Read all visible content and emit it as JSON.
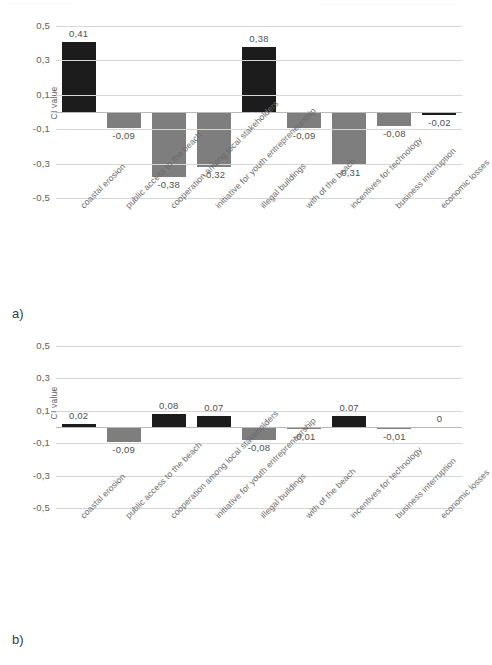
{
  "figure": {
    "panel_a_letter": "a)",
    "panel_b_letter": "b)",
    "caption": ""
  },
  "colors": {
    "dark_bar": "#1c1c1c",
    "grey_bar": "#7e7e7e",
    "gridline": "#d6d6d6",
    "zero_line": "#b9b9b9",
    "text": "#5d5d5d"
  },
  "chart_data": [
    {
      "id": "chart-a",
      "type": "bar",
      "title": "",
      "xlabel": "",
      "ylabel": "CI value",
      "ylim": [
        -0.5,
        0.5
      ],
      "yticks": [
        "0,5",
        "0,3",
        "0,1",
        "-0,1",
        "-0,3",
        "-0,5"
      ],
      "ytick_values": [
        0.5,
        0.3,
        0.1,
        -0.1,
        -0.3,
        -0.5
      ],
      "grid": true,
      "legend": "none",
      "categories": [
        "coastal erosion",
        "public access to the beach",
        "cooperation among local stakeholders",
        "initiative for youth entrepreneurship",
        "illegal buildings",
        "with of the beach",
        "incentives for technology",
        "business interruption",
        "economic losses"
      ],
      "values": [
        0.41,
        -0.09,
        -0.38,
        -0.32,
        0.38,
        -0.09,
        -0.31,
        -0.08,
        -0.02
      ],
      "labels": [
        "0,41",
        "-0,09",
        "-0,38",
        "-0,32",
        "0,38",
        "-0,09",
        "-0,31",
        "-0,08",
        "-0,02"
      ],
      "bar_colors": [
        "dark",
        "grey",
        "grey",
        "grey",
        "dark",
        "grey",
        "grey",
        "grey",
        "dark"
      ]
    },
    {
      "id": "chart-b",
      "type": "bar",
      "title": "",
      "xlabel": "",
      "ylabel": "CI value",
      "ylim": [
        -0.5,
        0.5
      ],
      "yticks": [
        "0,5",
        "0,3",
        "0,1",
        "-0,1",
        "-0,3",
        "-0,5"
      ],
      "ytick_values": [
        0.5,
        0.3,
        0.1,
        -0.1,
        -0.3,
        -0.5
      ],
      "grid": true,
      "legend": "none",
      "categories": [
        "coastal erosion",
        "public access to the beach",
        "cooperation among local stakeholders",
        "initiative for youth entrepreneurship",
        "illegal buildings",
        "with of the beach",
        "incentives for technology",
        "business interruption",
        "economic losses"
      ],
      "values": [
        0.02,
        -0.09,
        0.08,
        0.07,
        -0.08,
        -0.01,
        0.07,
        -0.01,
        0
      ],
      "labels": [
        "0,02",
        "-0,09",
        "0,08",
        "0,07",
        "-0,08",
        "-0,01",
        "0,07",
        "-0,01",
        "0"
      ],
      "bar_colors": [
        "dark",
        "grey",
        "dark",
        "dark",
        "grey",
        "grey",
        "dark",
        "grey",
        "none"
      ]
    }
  ]
}
